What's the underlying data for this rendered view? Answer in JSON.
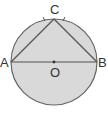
{
  "diagram": {
    "colors": {
      "fill": "#d9d9d9",
      "stroke": "#666666",
      "label": "#333333",
      "background": "#ffffff"
    },
    "circle": {
      "center": "O",
      "cx": 54,
      "cy": 62,
      "r": 43
    },
    "points": [
      {
        "id": "A",
        "label": "A",
        "x": 11,
        "y": 62
      },
      {
        "id": "B",
        "label": "B",
        "x": 97,
        "y": 62
      },
      {
        "id": "C",
        "label": "C",
        "x": 54,
        "y": 19
      },
      {
        "id": "O",
        "label": "O",
        "x": 54,
        "y": 62
      }
    ],
    "segments": [
      {
        "from": "A",
        "to": "B",
        "name": "diameter-AB"
      },
      {
        "from": "A",
        "to": "C",
        "name": "chord-AC"
      },
      {
        "from": "C",
        "to": "B",
        "name": "chord-CB"
      }
    ],
    "arc_ticks": [
      "arc-AC",
      "arc-CB"
    ],
    "labels": {
      "A": "A",
      "B": "B",
      "C": "C",
      "O": "O"
    }
  }
}
